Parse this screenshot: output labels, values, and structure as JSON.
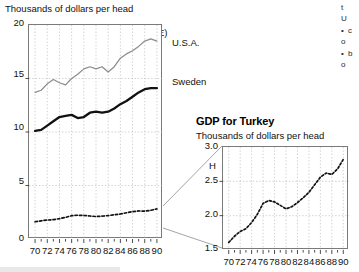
{
  "figure": {
    "main_axis_label": "Thousands of dollars per head",
    "panel_tag": "G (enlargement of y-scale in E)",
    "series_label_usa": "U.S.A.",
    "series_label_sweden": "Sweden"
  },
  "inset": {
    "title": "GDP for Turkey",
    "axis_label": "Thousands of dollars per head",
    "panel_tag": "H"
  },
  "margin_note": {
    "lines": [
      "t",
      "U",
      "c",
      "o",
      "b",
      "o"
    ]
  },
  "colors": {
    "usa_line": "#8d8d8d",
    "sweden_line": "#111111",
    "turkey_line": "#111111",
    "grid": "#bdbdbd",
    "axis": "#6f6f6f"
  },
  "chart_data": [
    {
      "type": "line",
      "id": "G",
      "title": "G (enlargement of y-scale in E)",
      "xlabel": "",
      "ylabel": "Thousands of dollars per head",
      "xlim": [
        69,
        91
      ],
      "ylim": [
        0,
        20
      ],
      "yticks": [
        0,
        5,
        10,
        15,
        20
      ],
      "ytick_labels": [
        "0",
        "5",
        "10",
        "15",
        "20"
      ],
      "xticks": [
        70,
        72,
        74,
        76,
        78,
        80,
        82,
        84,
        86,
        88,
        90
      ],
      "xtick_labels": [
        "70",
        "72",
        "74",
        "76",
        "78",
        "80",
        "82",
        "84",
        "86",
        "88",
        "90"
      ],
      "minor_xticks_every": 1,
      "grid": true,
      "legend": "inline-right-labels",
      "x": [
        70,
        71,
        72,
        73,
        74,
        75,
        76,
        77,
        78,
        79,
        80,
        81,
        82,
        83,
        84,
        85,
        86,
        87,
        88,
        89,
        90
      ],
      "series": [
        {
          "name": "U.S.A.",
          "style": "thin-grey-solid",
          "values": [
            13.7,
            13.9,
            14.5,
            14.9,
            14.6,
            14.4,
            15.0,
            15.4,
            15.9,
            16.1,
            15.9,
            16.1,
            15.6,
            16.1,
            16.9,
            17.3,
            17.6,
            18.0,
            18.5,
            18.7,
            18.5
          ]
        },
        {
          "name": "Sweden",
          "style": "thick-black-solid",
          "values": [
            10.1,
            10.2,
            10.6,
            11.0,
            11.4,
            11.5,
            11.6,
            11.3,
            11.4,
            11.8,
            11.9,
            11.8,
            11.9,
            12.2,
            12.6,
            12.9,
            13.3,
            13.7,
            14.0,
            14.1,
            14.1
          ]
        },
        {
          "name": "Turkey",
          "style": "black-dotted",
          "values": [
            1.61,
            1.7,
            1.77,
            1.81,
            1.9,
            2.02,
            2.18,
            2.22,
            2.2,
            2.15,
            2.1,
            2.13,
            2.19,
            2.26,
            2.34,
            2.45,
            2.56,
            2.62,
            2.6,
            2.68,
            2.82
          ]
        }
      ]
    },
    {
      "type": "line",
      "id": "H",
      "title": "GDP for Turkey",
      "xlabel": "",
      "ylabel": "Thousands of dollars per head",
      "xlim": [
        69,
        91
      ],
      "ylim": [
        1.5,
        3.0
      ],
      "yticks": [
        1.5,
        2.0,
        2.5,
        3.0
      ],
      "ytick_labels": [
        "1.5",
        "2.0",
        "2.5",
        "3.0"
      ],
      "xticks": [
        70,
        72,
        74,
        76,
        78,
        80,
        82,
        84,
        86,
        88,
        90
      ],
      "xtick_labels": [
        "70",
        "72",
        "74",
        "76",
        "78",
        "80",
        "82",
        "84",
        "86",
        "88",
        "90"
      ],
      "minor_xticks_every": 1,
      "grid": true,
      "x": [
        70,
        71,
        72,
        73,
        74,
        75,
        76,
        77,
        78,
        79,
        80,
        81,
        82,
        83,
        84,
        85,
        86,
        87,
        88,
        89,
        90
      ],
      "series": [
        {
          "name": "Turkey",
          "style": "black-dotted",
          "values": [
            1.61,
            1.7,
            1.77,
            1.81,
            1.9,
            2.02,
            2.18,
            2.22,
            2.2,
            2.15,
            2.1,
            2.13,
            2.19,
            2.26,
            2.34,
            2.45,
            2.56,
            2.62,
            2.6,
            2.68,
            2.82
          ]
        }
      ]
    }
  ]
}
